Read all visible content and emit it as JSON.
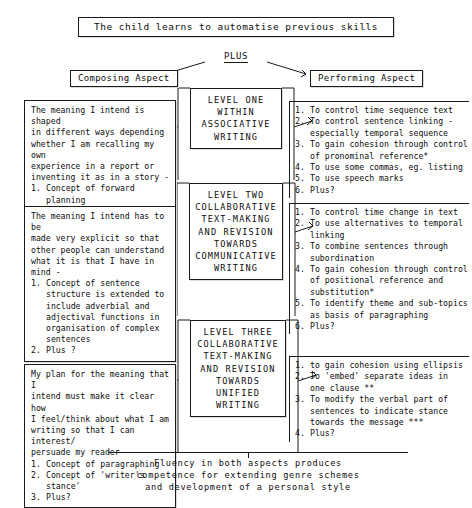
{
  "diagram": {
    "title": "The child learns to automatise previous skills",
    "plus_label": "PLUS",
    "aspect_left": "Composing Aspect",
    "aspect_right": "Performing Aspect",
    "footer": [
      "Fluency in both aspects produces",
      "competence for extending genre schemes",
      "and development of a personal style"
    ],
    "levels": [
      {
        "lines": [
          "LEVEL ONE",
          "WITHIN",
          "ASSOCIATIVE",
          "WRITING"
        ]
      },
      {
        "lines": [
          "LEVEL TWO",
          "COLLABORATIVE",
          "TEXT-MAKING",
          "AND REVISION",
          "TOWARDS",
          "COMMUNICATIVE",
          "WRITING"
        ]
      },
      {
        "lines": [
          "LEVEL THREE",
          "COLLABORATIVE",
          "TEXT-MAKING",
          "AND REVISION",
          "TOWARDS",
          "UNIFIED WRITING"
        ]
      }
    ],
    "composing": [
      {
        "intro": [
          "The meaning I intend is shaped",
          "in different ways depending",
          "whether I am recalling my own",
          "experience in a report or",
          "inventing it as in a story -"
        ],
        "items": [
          {
            "n": "1.",
            "lines": [
              "Concept of forward planning",
              "in terms of above",
              "distinction"
            ]
          },
          {
            "n": "2.",
            "lines": [
              "Plus?"
            ]
          }
        ]
      },
      {
        "intro": [
          "The meaning I intend has to be",
          "made very explicit so that",
          "other people can understand",
          "what it is that I have in mind -"
        ],
        "items": [
          {
            "n": "1.",
            "lines": [
              "Concept of sentence",
              "structure is extended to",
              "include adverbial and",
              "adjectival functions in",
              "organisation of complex",
              "sentences"
            ]
          },
          {
            "n": "2.",
            "lines": [
              "Plus ?"
            ]
          }
        ]
      },
      {
        "intro": [
          "My plan for the meaning that I",
          "intend must make it clear how",
          "I feel/think about what I am",
          "writing so that I can interest/",
          "persuade my reader -"
        ],
        "items": [
          {
            "n": "1.",
            "lines": [
              "Concept of paragraphing"
            ]
          },
          {
            "n": "2.",
            "lines": [
              "Concept of 'writer's stance'"
            ]
          },
          {
            "n": "3.",
            "lines": [
              "Plus?"
            ]
          }
        ]
      }
    ],
    "performing": [
      {
        "items": [
          {
            "n": "1.",
            "lines": [
              "To control time sequence text"
            ]
          },
          {
            "n": "2.",
            "lines": [
              "To control sentence linking -",
              "especially temporal sequence"
            ]
          },
          {
            "n": "3.",
            "lines": [
              "To gain cohesion through control",
              "of pronominal reference*"
            ]
          },
          {
            "n": "4.",
            "lines": [
              "To use some commas, eg. listing"
            ]
          },
          {
            "n": "5.",
            "lines": [
              "To use speech marks"
            ]
          },
          {
            "n": "6.",
            "lines": [
              "Plus?"
            ]
          }
        ]
      },
      {
        "items": [
          {
            "n": "1.",
            "lines": [
              "To control time change in text"
            ]
          },
          {
            "n": "2.",
            "lines": [
              "To use alternatives to temporal",
              "linking"
            ]
          },
          {
            "n": "3.",
            "lines": [
              "To combine sentences through",
              "subordination"
            ]
          },
          {
            "n": "4.",
            "lines": [
              "To gain cohesion through control",
              "of positional reference and",
              "substitution*"
            ]
          },
          {
            "n": "5.",
            "lines": [
              "To identify theme and sub-topics",
              "as basis of paragraphing"
            ]
          },
          {
            "n": "6.",
            "lines": [
              "Plus?"
            ]
          }
        ]
      },
      {
        "items": [
          {
            "n": "1.",
            "lines": [
              "to gain cohesion using ellipsis"
            ]
          },
          {
            "n": "2.",
            "lines": [
              "To 'embed' separate ideas in",
              "one clause **"
            ]
          },
          {
            "n": "3.",
            "lines": [
              "To modify the verbal part of",
              "sentences to indicate stance",
              "towards the message ***"
            ]
          },
          {
            "n": "4.",
            "lines": [
              "Plus?"
            ]
          }
        ]
      }
    ],
    "colors": {
      "ink": "#0d0d0d",
      "line": "#1a1a1a",
      "paper": "#ffffff"
    }
  }
}
